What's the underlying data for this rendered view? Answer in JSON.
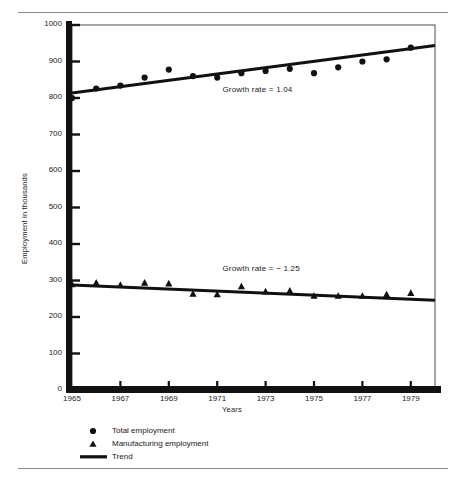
{
  "chart_data": {
    "type": "scatter",
    "title": "",
    "xlabel": "Years",
    "ylabel": "Employment in thousands",
    "xlim": [
      1965,
      1980
    ],
    "ylim": [
      0,
      1000
    ],
    "grid": false,
    "legend_position": "below-axes-left",
    "x_ticks": [
      "1965",
      "1967",
      "1969",
      "1971",
      "1973",
      "1975",
      "1977",
      "1979"
    ],
    "x_tick_values": [
      1965,
      1967,
      1969,
      1971,
      1973,
      1975,
      1977,
      1979
    ],
    "y_ticks": [
      "0",
      "100",
      "200",
      "300",
      "400",
      "500",
      "600",
      "700",
      "800",
      "900",
      "1000"
    ],
    "y_tick_values": [
      0,
      100,
      200,
      300,
      400,
      500,
      600,
      700,
      800,
      900,
      1000
    ],
    "x": [
      1965,
      1966,
      1967,
      1968,
      1969,
      1970,
      1971,
      1972,
      1973,
      1974,
      1975,
      1976,
      1977,
      1978,
      1979
    ],
    "series": [
      {
        "name": "Total employment",
        "marker": "circle",
        "values": [
          800,
          826,
          834,
          856,
          878,
          860,
          856,
          868,
          874,
          880,
          868,
          884,
          900,
          906,
          938
        ]
      },
      {
        "name": "Manufacturing employment",
        "marker": "triangle",
        "values": [
          290,
          294,
          288,
          294,
          292,
          264,
          262,
          284,
          270,
          272,
          258,
          258,
          258,
          262,
          266
        ]
      },
      {
        "name": "Trend (Total employment)",
        "marker": "line",
        "endpoints": [
          [
            1965,
            814
          ],
          [
            1980,
            944
          ]
        ]
      },
      {
        "name": "Trend (Manufacturing employment)",
        "marker": "line",
        "endpoints": [
          [
            1965,
            288
          ],
          [
            1980,
            246
          ]
        ]
      }
    ],
    "annotations": [
      {
        "text": "Growth rate  =  1.04",
        "x": 1973.2,
        "y": 818
      },
      {
        "text": "Growth rate  =  − 1.25",
        "x": 1973.2,
        "y": 330
      }
    ],
    "legend": [
      {
        "label": "Total employment",
        "marker": "circle"
      },
      {
        "label": "Manufacturing employment",
        "marker": "triangle"
      },
      {
        "label": "Trend",
        "marker": "line"
      }
    ]
  },
  "colors": {
    "ink": "#111111",
    "rule": "#8a8a8a",
    "frame": "#3a3a3a",
    "background": "#ffffff"
  }
}
